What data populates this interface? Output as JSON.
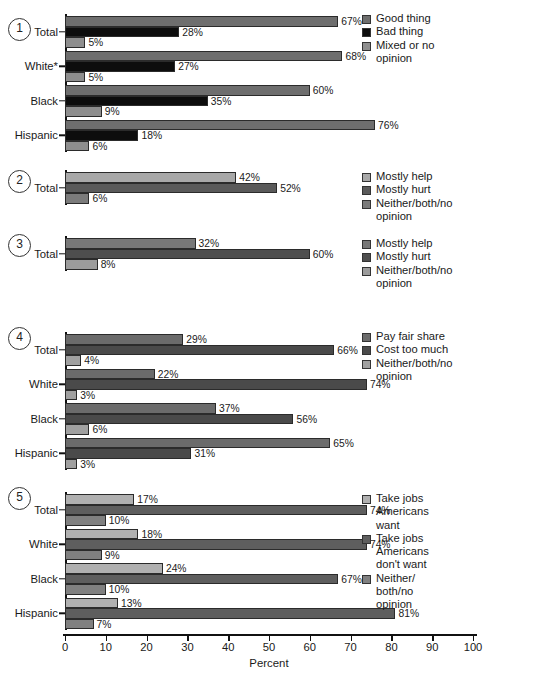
{
  "axis": {
    "title": "Percent",
    "ticks": [
      0,
      10,
      20,
      30,
      40,
      50,
      60,
      70,
      80,
      90,
      100
    ],
    "min": 0,
    "max": 100
  },
  "colors": {
    "series1_good": "#6e6e6e",
    "series1_bad": "#0d0d0d",
    "series1_mixed": "#8e8e8e",
    "axis": "#111111",
    "text": "#1a1a1a"
  },
  "chart_data": [
    {
      "type": "bar",
      "panel": "1",
      "orientation": "horizontal",
      "title": "",
      "xlabel": "Percent",
      "ylabel": "",
      "xlim": [
        0,
        100
      ],
      "grid": false,
      "legend_position": "right",
      "categories": [
        "Total",
        "White*",
        "Black",
        "Hispanic"
      ],
      "series": [
        {
          "name": "Good thing",
          "values": [
            67,
            68,
            60,
            76
          ],
          "labels": [
            "67%",
            "68%",
            "60%",
            "76%"
          ],
          "swatch": "#6e6e6e"
        },
        {
          "name": "Bad thing",
          "values": [
            28,
            27,
            35,
            18
          ],
          "labels": [
            "28%",
            "27%",
            "35%",
            "18%"
          ],
          "swatch": "#0d0d0d"
        },
        {
          "name": "Mixed or no\nopinion",
          "values": [
            5,
            5,
            9,
            6
          ],
          "labels": [
            "5%",
            "5%",
            "9%",
            "6%"
          ],
          "swatch": "#8e8e8e"
        }
      ]
    },
    {
      "type": "bar",
      "panel": "2",
      "orientation": "horizontal",
      "title": "",
      "xlabel": "Percent",
      "ylabel": "",
      "xlim": [
        0,
        100
      ],
      "grid": false,
      "legend_position": "right",
      "categories": [
        "Total"
      ],
      "series": [
        {
          "name": "Mostly help",
          "values": [
            42
          ],
          "labels": [
            "42%"
          ],
          "swatch": "#a8a8a8"
        },
        {
          "name": "Mostly hurt",
          "values": [
            52
          ],
          "labels": [
            "52%"
          ],
          "swatch": "#5a5a5a"
        },
        {
          "name": "Neither/both/no\nopinion",
          "values": [
            6
          ],
          "labels": [
            "6%"
          ],
          "swatch": "#7b7b7b"
        }
      ]
    },
    {
      "type": "bar",
      "panel": "3",
      "orientation": "horizontal",
      "title": "",
      "xlabel": "Percent",
      "ylabel": "",
      "xlim": [
        0,
        100
      ],
      "grid": false,
      "legend_position": "right",
      "categories": [
        "Total"
      ],
      "series": [
        {
          "name": "Mostly help",
          "values": [
            32
          ],
          "labels": [
            "32%"
          ],
          "swatch": "#787878"
        },
        {
          "name": "Mostly hurt",
          "values": [
            60
          ],
          "labels": [
            "60%"
          ],
          "swatch": "#4e4e4e"
        },
        {
          "name": "Neither/both/no\nopinion",
          "values": [
            8
          ],
          "labels": [
            "8%"
          ],
          "swatch": "#9c9c9c"
        }
      ]
    },
    {
      "type": "bar",
      "panel": "4",
      "orientation": "horizontal",
      "title": "",
      "xlabel": "Percent",
      "ylabel": "",
      "xlim": [
        0,
        100
      ],
      "grid": false,
      "legend_position": "right",
      "categories": [
        "Total",
        "White",
        "Black",
        "Hispanic"
      ],
      "series": [
        {
          "name": "Pay fair share",
          "values": [
            29,
            22,
            37,
            65
          ],
          "labels": [
            "29%",
            "22%",
            "37%",
            "65%"
          ],
          "swatch": "#6b6b6b"
        },
        {
          "name": "Cost too much",
          "values": [
            66,
            74,
            56,
            31
          ],
          "labels": [
            "66%",
            "74%",
            "56%",
            "31%"
          ],
          "swatch": "#4a4a4a"
        },
        {
          "name": "Neither/both/no\nopinion",
          "values": [
            4,
            3,
            6,
            3
          ],
          "labels": [
            "4%",
            "3%",
            "6%",
            "3%"
          ],
          "swatch": "#a0a0a0"
        }
      ]
    },
    {
      "type": "bar",
      "panel": "5",
      "orientation": "horizontal",
      "title": "",
      "xlabel": "Percent",
      "ylabel": "",
      "xlim": [
        0,
        100
      ],
      "grid": false,
      "legend_position": "right",
      "categories": [
        "Total",
        "White",
        "Black",
        "Hispanic"
      ],
      "series": [
        {
          "name": "Take jobs\nAmericans\nwant",
          "values": [
            17,
            18,
            24,
            13
          ],
          "labels": [
            "17%",
            "18%",
            "24%",
            "13%"
          ],
          "swatch": "#b0b0b0"
        },
        {
          "name": "Take jobs\nAmericans\ndon't want",
          "values": [
            74,
            74,
            67,
            81
          ],
          "labels": [
            "74%",
            "74%",
            "67%",
            "81%"
          ],
          "swatch": "#5e5e5e"
        },
        {
          "name": "Neither/\nboth/no\nopinion",
          "values": [
            10,
            9,
            10,
            7
          ],
          "labels": [
            "10%",
            "9%",
            "10%",
            "7%"
          ],
          "swatch": "#808080"
        }
      ]
    }
  ],
  "layout": {
    "plot_left": 65,
    "plot_right": 473,
    "label_right": 58,
    "legend_left": 362,
    "panels": [
      {
        "num": "1",
        "num_top": 18,
        "plot_top": 14,
        "bar_h": 10.5,
        "group_h": 34.5,
        "legend_top": 12,
        "class": "s"
      },
      {
        "num": "2",
        "num_top": 170,
        "plot_top": 170,
        "bar_h": 10.5,
        "group_h": 34.5,
        "legend_top": 170,
        "class": "t"
      },
      {
        "num": "3",
        "num_top": 234,
        "plot_top": 236,
        "bar_h": 10.5,
        "group_h": 34.5,
        "legend_top": 237,
        "class": "u"
      },
      {
        "num": "4",
        "num_top": 327,
        "plot_top": 332,
        "bar_h": 10.5,
        "group_h": 34.5,
        "legend_top": 330,
        "class": "v"
      },
      {
        "num": "5",
        "num_top": 487,
        "plot_top": 492,
        "bar_h": 10.5,
        "group_h": 34.5,
        "legend_top": 492,
        "class": "w"
      }
    ],
    "xaxis_y": 634,
    "xlab_y": 641,
    "xtitle_y": 657
  }
}
